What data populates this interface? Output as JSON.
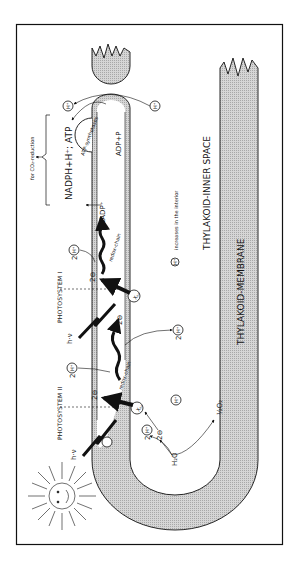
{
  "diagram": {
    "orientation": "rotated 90° counter-clockwise; text reads bottom-to-top",
    "regions": {
      "inner_space": "THYLAKOID-INNER SPACE",
      "membrane": "THYLAKOID-MEMBRANE"
    },
    "photosystems": {
      "ps1": "PHOTOSYSTEM I",
      "ps2": "PHOTOSYSTEM II"
    },
    "light": {
      "ps1_photon": "h·ν",
      "ps2_photon": "h·ν"
    },
    "electrons": {
      "two_e": "2⊖",
      "two_e_ps1": "2⊖",
      "two_e_ps2": "2⊖",
      "two_e_water": "2⊖",
      "two_e_xr": "2⊖"
    },
    "chains": {
      "redox_chain_1": "redox-chain",
      "redox_chain_2": "redox-chain"
    },
    "carriers": {
      "xr_ps1": "Xₒₓ",
      "xr_ps2": "Xₒₓ"
    },
    "protons": {
      "h_plus": "H⁺",
      "two_h_ps1": "2",
      "two_h_mid": "2",
      "two_h_water": "2",
      "two_h_ps2": "2",
      "legend_text": "increases in the interior"
    },
    "products": {
      "nadp": "NADP⁺",
      "nadph": "NADPH+H⁺; ATP",
      "co2": "for CO₂-reduction",
      "adp": "ADP+P",
      "atp_synthase": "ATP-synthetases"
    },
    "water": {
      "h2o": "H₂O",
      "o2": "½O₂"
    },
    "colors": {
      "line": "#111111",
      "membrane_fill": "#c8c8c8",
      "background": "#ffffff"
    }
  }
}
